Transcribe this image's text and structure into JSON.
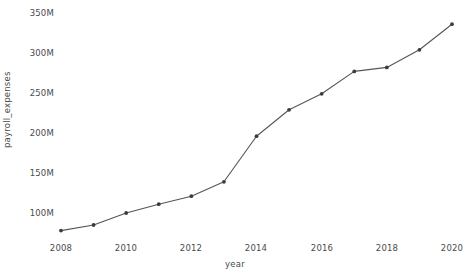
{
  "chart_data": {
    "type": "line",
    "title": "",
    "xlabel": "year",
    "ylabel": "payroll_expenses",
    "x": [
      2008,
      2009,
      2010,
      2011,
      2012,
      2013,
      2014,
      2015,
      2016,
      2017,
      2018,
      2019,
      2020
    ],
    "values": [
      78000000,
      85000000,
      100000000,
      111000000,
      121000000,
      139000000,
      196000000,
      229000000,
      249000000,
      277000000,
      282000000,
      304000000,
      336000000
    ],
    "series": [
      {
        "name": "payroll_expenses",
        "values": [
          78000000,
          85000000,
          100000000,
          111000000,
          121000000,
          139000000,
          196000000,
          229000000,
          249000000,
          277000000,
          282000000,
          304000000,
          336000000
        ]
      }
    ],
    "xlim": [
      2007.5,
      2020.6
    ],
    "ylim": [
      70000000,
      352000000
    ],
    "xticks": [
      2008,
      2010,
      2012,
      2014,
      2016,
      2018,
      2020
    ],
    "xtick_labels": [
      "2008",
      "2010",
      "2012",
      "2014",
      "2016",
      "2018",
      "2020"
    ],
    "yticks": [
      100000000,
      150000000,
      200000000,
      250000000,
      300000000,
      350000000
    ],
    "ytick_labels": [
      "100M",
      "150M",
      "200M",
      "250M",
      "300M",
      "350M"
    ],
    "grid": false,
    "legend": false,
    "legend_position": "none",
    "line_color": "#555555",
    "marker_color": "#3c3c3c",
    "marker": "circle",
    "background_color": "#ffffff",
    "text_color": "#4a4a4a"
  }
}
